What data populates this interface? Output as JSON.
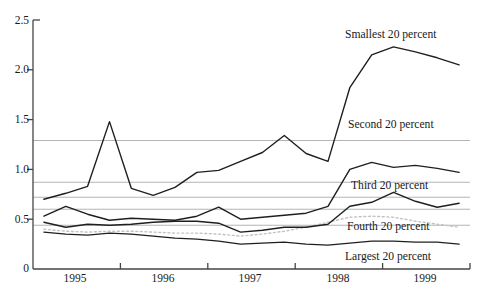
{
  "figure": {
    "background_color": "#ffffff",
    "series_line_color": "#1f1f1f",
    "reference_line_color": "#b5b5b5",
    "dotted_line_color": "#c3c3c3",
    "axis_color": "#454545",
    "text_color": "#1a1a1a"
  },
  "chart_data": {
    "type": "line",
    "title": "",
    "xlabel": "",
    "ylabel": "",
    "x_sampling": "quarterly",
    "x_range": [
      1995,
      2000
    ],
    "x_tick_labels": [
      "1995",
      "1996",
      "1997",
      "1998",
      "1999"
    ],
    "y_tick_labels": [
      "2.5",
      "2.0",
      "1.5",
      "1.0",
      "0.5",
      "0"
    ],
    "y_tick_values": [
      2.5,
      2.0,
      1.5,
      1.0,
      0.5,
      0
    ],
    "ylim": [
      0,
      2.5
    ],
    "grid": false,
    "legend_position": "inline-labels-right",
    "reference_line_values": [
      1.29,
      0.87,
      0.72,
      0.6,
      0.44
    ],
    "series": [
      {
        "name": "Smallest 20 percent",
        "line_style": "solid",
        "values": [
          0.7,
          0.76,
          0.83,
          1.48,
          0.81,
          0.74,
          0.82,
          0.97,
          0.99,
          1.08,
          1.17,
          1.34,
          1.16,
          1.08,
          1.82,
          2.15,
          2.23,
          2.18,
          2.12,
          2.05
        ]
      },
      {
        "name": "Second 20 percent",
        "line_style": "solid",
        "values": [
          0.53,
          0.63,
          0.55,
          0.49,
          0.51,
          0.5,
          0.49,
          0.53,
          0.62,
          0.5,
          0.52,
          0.54,
          0.56,
          0.63,
          1.0,
          1.07,
          1.02,
          1.04,
          1.01,
          0.97
        ]
      },
      {
        "name": "Third 20 percent",
        "line_style": "solid",
        "values": [
          0.47,
          0.42,
          0.45,
          0.44,
          0.45,
          0.47,
          0.48,
          0.48,
          0.46,
          0.37,
          0.39,
          0.42,
          0.42,
          0.45,
          0.63,
          0.67,
          0.77,
          0.68,
          0.62,
          0.66
        ]
      },
      {
        "name": "Fourth 20 percent",
        "line_style": "dotted",
        "values": [
          0.4,
          0.38,
          0.37,
          0.38,
          0.38,
          0.37,
          0.36,
          0.36,
          0.35,
          0.33,
          0.35,
          0.38,
          0.42,
          0.47,
          0.52,
          0.53,
          0.52,
          0.48,
          0.45,
          0.42
        ]
      },
      {
        "name": "Largest 20 percent",
        "line_style": "solid",
        "values": [
          0.37,
          0.35,
          0.34,
          0.36,
          0.35,
          0.33,
          0.31,
          0.3,
          0.28,
          0.25,
          0.26,
          0.27,
          0.25,
          0.24,
          0.26,
          0.28,
          0.28,
          0.27,
          0.27,
          0.25
        ]
      }
    ]
  }
}
